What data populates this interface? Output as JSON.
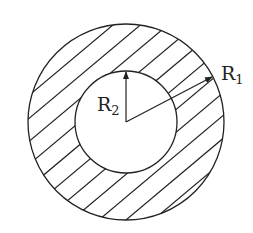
{
  "diagram": {
    "type": "annulus-cross-section",
    "center": {
      "x": 126,
      "y": 122
    },
    "outer_circle": {
      "radius": 98,
      "label": "R",
      "subscript": "1"
    },
    "inner_circle": {
      "radius": 51,
      "label": "R",
      "subscript": "2"
    },
    "hatching": {
      "angle_deg": -40,
      "spacing": 18,
      "region": "between circles"
    },
    "colors": {
      "stroke": "#222222",
      "background": "#ffffff"
    }
  },
  "labels": {
    "r1_main": "R",
    "r1_sub": "1",
    "r2_main": "R",
    "r2_sub": "2"
  }
}
